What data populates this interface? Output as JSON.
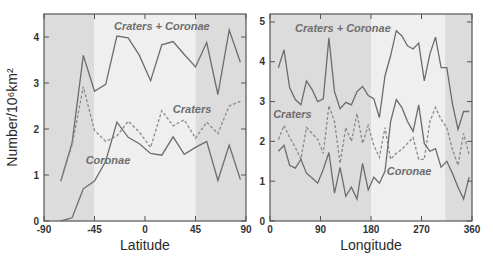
{
  "chart_data": [
    {
      "type": "line",
      "panel": "left",
      "xlabel": "Latitude",
      "ylabel": "Number/10^6 km^2",
      "ylabel_display": "Number/10⁶km²",
      "xlim": [
        -90,
        90
      ],
      "ylim": [
        0,
        4.5
      ],
      "x_ticks": [
        -90,
        -45,
        0,
        45,
        90
      ],
      "x_tick_labels": [
        "-90",
        "-45",
        "0",
        "45",
        "90"
      ],
      "y_ticks": [
        0,
        1,
        2,
        3,
        4
      ],
      "y_tick_labels": [
        "0",
        "1",
        "2",
        "3",
        "4"
      ],
      "grid": false,
      "shaded_bands": [
        {
          "from": -90,
          "to": -45,
          "shade": "dark"
        },
        {
          "from": -45,
          "to": 45,
          "shade": "light"
        },
        {
          "from": 45,
          "to": 90,
          "shade": "dark"
        }
      ],
      "x": [
        -75,
        -65,
        -55,
        -45,
        -35,
        -25,
        -15,
        -5,
        5,
        15,
        25,
        35,
        45,
        55,
        65,
        75,
        85
      ],
      "series": [
        {
          "name": "Craters + Coronae",
          "style": "solid",
          "values": [
            0.87,
            1.7,
            3.6,
            2.82,
            2.97,
            4.02,
            3.98,
            3.6,
            3.05,
            3.83,
            3.9,
            3.62,
            3.35,
            3.88,
            2.75,
            4.15,
            3.45
          ]
        },
        {
          "name": "Craters",
          "style": "dashed",
          "values": [
            0.87,
            1.65,
            2.92,
            1.97,
            1.73,
            1.85,
            2.17,
            1.93,
            1.6,
            2.4,
            2.07,
            2.2,
            1.8,
            2.15,
            1.9,
            2.5,
            2.6
          ]
        },
        {
          "name": "Coronae",
          "style": "solid",
          "values": [
            0.0,
            0.07,
            0.7,
            0.87,
            1.3,
            2.15,
            1.82,
            1.68,
            1.47,
            1.43,
            1.83,
            1.45,
            1.6,
            1.73,
            0.88,
            1.65,
            0.9
          ]
        }
      ],
      "annotations": [
        {
          "text": "Craters + Coronae",
          "x": 15,
          "y": 4.15
        },
        {
          "text": "Craters",
          "x": 42,
          "y": 2.35
        },
        {
          "text": "Coronae",
          "x": -33,
          "y": 1.25
        }
      ]
    },
    {
      "type": "line",
      "panel": "right",
      "xlabel": "Longitude",
      "ylabel": "",
      "xlim": [
        0,
        360
      ],
      "ylim": [
        0,
        5.2
      ],
      "x_ticks": [
        0,
        90,
        180,
        270,
        360
      ],
      "x_tick_labels": [
        "0",
        "90",
        "180",
        "270",
        "360"
      ],
      "y_ticks": [
        0,
        1,
        2,
        3,
        4,
        5
      ],
      "y_tick_labels": [
        "0",
        "1",
        "2",
        "3",
        "4",
        "5"
      ],
      "grid": false,
      "shaded_bands": [
        {
          "from": 0,
          "to": 180,
          "shade": "dark"
        },
        {
          "from": 180,
          "to": 312,
          "shade": "light"
        },
        {
          "from": 312,
          "to": 360,
          "shade": "dark"
        }
      ],
      "x": [
        15,
        25,
        35,
        45,
        55,
        65,
        75,
        85,
        95,
        105,
        115,
        125,
        135,
        145,
        155,
        165,
        175,
        185,
        195,
        205,
        215,
        225,
        235,
        245,
        255,
        265,
        275,
        285,
        295,
        305,
        315,
        325,
        335,
        345,
        355
      ],
      "series": [
        {
          "name": "Craters + Coronae",
          "style": "solid",
          "values": [
            3.85,
            4.3,
            3.35,
            3.05,
            2.92,
            3.52,
            3.3,
            3.0,
            3.07,
            4.6,
            3.25,
            2.82,
            2.98,
            2.92,
            3.25,
            3.38,
            3.15,
            3.07,
            2.6,
            3.65,
            4.15,
            4.78,
            4.65,
            4.4,
            4.32,
            4.47,
            3.52,
            4.2,
            4.62,
            3.85,
            3.85,
            2.95,
            2.3,
            2.75,
            2.75
          ]
        },
        {
          "name": "Craters",
          "style": "dashed",
          "values": [
            2.05,
            2.4,
            2.1,
            1.85,
            1.55,
            2.35,
            2.2,
            2.05,
            1.7,
            2.9,
            2.5,
            1.45,
            2.35,
            2.0,
            2.7,
            1.95,
            2.4,
            1.9,
            1.6,
            2.35,
            1.55,
            1.7,
            1.8,
            1.95,
            2.1,
            1.55,
            1.55,
            2.5,
            2.85,
            2.55,
            2.35,
            1.8,
            1.4,
            2.2,
            1.65
          ]
        },
        {
          "name": "Coronae",
          "style": "solid",
          "values": [
            1.75,
            1.9,
            1.4,
            1.33,
            1.55,
            1.2,
            1.08,
            0.95,
            1.3,
            1.72,
            0.7,
            1.35,
            0.62,
            0.85,
            0.55,
            1.45,
            0.78,
            1.1,
            0.95,
            1.25,
            2.5,
            3.05,
            2.85,
            2.5,
            2.25,
            2.92,
            1.95,
            1.75,
            1.82,
            1.35,
            1.5,
            1.2,
            0.85,
            0.55,
            1.1
          ]
        }
      ],
      "annotations": [
        {
          "text": "Craters + Coronae",
          "x": 130,
          "y": 4.75
        },
        {
          "text": "Craters",
          "x": 40,
          "y": 2.6
        },
        {
          "text": "Coronae",
          "x": 248,
          "y": 1.15
        }
      ]
    }
  ]
}
